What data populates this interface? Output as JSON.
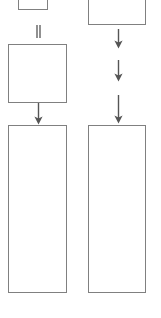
{
  "diagram": {
    "background_color": "#ffffff",
    "stroke_color": "#808080",
    "arrow_color": "#555555",
    "nodes": [
      {
        "id": "node-top-left-cut",
        "name": "cut-off-box-top-left",
        "label": "",
        "x": 18,
        "y": -12,
        "width": 30,
        "height": 22,
        "clipped": "top"
      },
      {
        "id": "node-top-right-cut",
        "name": "cut-off-box-top-right",
        "label": "",
        "x": 88,
        "y": -14,
        "width": 58,
        "height": 39,
        "clipped": "top"
      },
      {
        "id": "node-left-square",
        "name": "process-box-left-upper",
        "label": "",
        "x": 8,
        "y": 44,
        "width": 59,
        "height": 59,
        "clipped": "none"
      },
      {
        "id": "node-left-tall",
        "name": "process-box-left-lower",
        "label": "",
        "x": 8,
        "y": 125,
        "width": 59,
        "height": 168,
        "clipped": "none"
      },
      {
        "id": "node-right-tall",
        "name": "process-box-right-lower",
        "label": "",
        "x": 88,
        "y": 125,
        "width": 58,
        "height": 168,
        "clipped": "none"
      }
    ],
    "connectors": [
      {
        "id": "conn-top-left-stub",
        "name": "connector-top-left-stub",
        "label": "",
        "x": 37,
        "y": 25,
        "length": 12,
        "direction": "down",
        "head": false
      },
      {
        "id": "conn-left-square-to-tall",
        "name": "connector-left-square-to-tall",
        "label": "",
        "x": 38,
        "y": 103,
        "length": 21,
        "direction": "down",
        "head": true
      },
      {
        "id": "conn-right-1",
        "name": "connector-right-first",
        "label": "",
        "x": 118,
        "y": 29,
        "length": 19,
        "direction": "down",
        "head": true
      },
      {
        "id": "conn-right-2",
        "name": "connector-right-second",
        "label": "",
        "x": 118,
        "y": 60,
        "length": 21,
        "direction": "down",
        "head": true
      },
      {
        "id": "conn-right-3",
        "name": "connector-right-third",
        "label": "",
        "x": 118,
        "y": 95,
        "length": 28,
        "direction": "down",
        "head": true
      }
    ]
  }
}
